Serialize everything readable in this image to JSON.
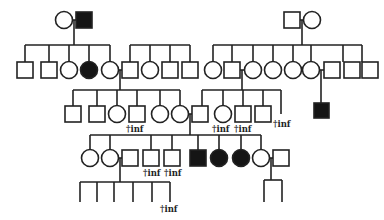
{
  "diagram": {
    "type": "pedigree",
    "label_text": "†inf",
    "colors": {
      "line": "#222222",
      "affected": "#151515",
      "unaffected": "#ffffff"
    },
    "generations": [
      {
        "id": "I",
        "individuals": [
          {
            "shape": "circle",
            "affected": false,
            "x": 64,
            "y": 20
          },
          {
            "shape": "square",
            "affected": true,
            "x": 84,
            "y": 20
          },
          {
            "shape": "square",
            "affected": false,
            "x": 292,
            "y": 20
          },
          {
            "shape": "circle",
            "affected": false,
            "x": 312,
            "y": 20
          }
        ]
      },
      {
        "id": "II",
        "individuals": [
          {
            "shape": "square",
            "affected": false,
            "x": 25,
            "y": 70
          },
          {
            "shape": "square",
            "affected": false,
            "x": 49,
            "y": 70
          },
          {
            "shape": "circle",
            "affected": false,
            "x": 69,
            "y": 70
          },
          {
            "shape": "circle",
            "affected": true,
            "x": 89,
            "y": 70
          },
          {
            "shape": "circle",
            "affected": false,
            "x": 110,
            "y": 70
          },
          {
            "shape": "square",
            "affected": false,
            "x": 130,
            "y": 70
          },
          {
            "shape": "circle",
            "affected": false,
            "x": 150,
            "y": 70
          },
          {
            "shape": "square",
            "affected": false,
            "x": 170,
            "y": 70
          },
          {
            "shape": "square",
            "affected": false,
            "x": 190,
            "y": 70
          },
          {
            "shape": "circle",
            "affected": false,
            "x": 213,
            "y": 70
          },
          {
            "shape": "square",
            "affected": false,
            "x": 232,
            "y": 70
          },
          {
            "shape": "circle",
            "affected": false,
            "x": 253,
            "y": 70
          },
          {
            "shape": "circle",
            "affected": false,
            "x": 273,
            "y": 70
          },
          {
            "shape": "circle",
            "affected": false,
            "x": 293,
            "y": 70
          },
          {
            "shape": "circle",
            "affected": false,
            "x": 313,
            "y": 70
          },
          {
            "shape": "square",
            "affected": false,
            "x": 333,
            "y": 70
          },
          {
            "shape": "square",
            "affected": false,
            "x": 352,
            "y": 70
          },
          {
            "shape": "square",
            "affected": false,
            "x": 370,
            "y": 70
          }
        ]
      },
      {
        "id": "III",
        "individuals": [
          {
            "shape": "square",
            "affected": false,
            "x": 73,
            "y": 114
          },
          {
            "shape": "square",
            "affected": false,
            "x": 97,
            "y": 114
          },
          {
            "shape": "circle",
            "affected": false,
            "x": 117,
            "y": 114
          },
          {
            "shape": "square",
            "affected": false,
            "x": 137,
            "y": 114,
            "note": "†inf"
          },
          {
            "shape": "circle",
            "affected": false,
            "x": 160,
            "y": 114
          },
          {
            "shape": "circle",
            "affected": false,
            "x": 180,
            "y": 114
          },
          {
            "shape": "square",
            "affected": false,
            "x": 200,
            "y": 114
          },
          {
            "shape": "circle",
            "affected": false,
            "x": 223,
            "y": 114,
            "note": "†inf"
          },
          {
            "shape": "square",
            "affected": false,
            "x": 243,
            "y": 114,
            "note": "†inf"
          },
          {
            "shape": "square",
            "affected": false,
            "x": 263,
            "y": 114
          },
          {
            "shape": "line",
            "affected": false,
            "x": 281,
            "y": 114,
            "note": "†inf"
          },
          {
            "shape": "square",
            "affected": true,
            "x": 321,
            "y": 111
          }
        ]
      },
      {
        "id": "IV",
        "individuals": [
          {
            "shape": "circle",
            "affected": false,
            "x": 90,
            "y": 158
          },
          {
            "shape": "circle",
            "affected": false,
            "x": 110,
            "y": 158
          },
          {
            "shape": "square",
            "affected": false,
            "x": 130,
            "y": 158
          },
          {
            "shape": "square",
            "affected": false,
            "x": 151,
            "y": 158,
            "note": "†inf"
          },
          {
            "shape": "square",
            "affected": false,
            "x": 172,
            "y": 158,
            "note": "†inf"
          },
          {
            "shape": "square",
            "affected": true,
            "x": 198,
            "y": 158
          },
          {
            "shape": "circle",
            "affected": true,
            "x": 219,
            "y": 158
          },
          {
            "shape": "circle",
            "affected": true,
            "x": 241,
            "y": 158
          },
          {
            "shape": "circle",
            "affected": false,
            "x": 261,
            "y": 158
          },
          {
            "shape": "square",
            "affected": false,
            "x": 281,
            "y": 158
          }
        ]
      },
      {
        "id": "V",
        "individuals": [
          {
            "shape": "line",
            "x": 80
          },
          {
            "shape": "line",
            "x": 97
          },
          {
            "shape": "line",
            "x": 114
          },
          {
            "shape": "line",
            "x": 133
          },
          {
            "shape": "line",
            "x": 152
          },
          {
            "shape": "line",
            "x": 170,
            "note": "†inf"
          },
          {
            "shape": "line",
            "x": 265
          },
          {
            "shape": "line",
            "x": 282
          }
        ]
      }
    ]
  }
}
